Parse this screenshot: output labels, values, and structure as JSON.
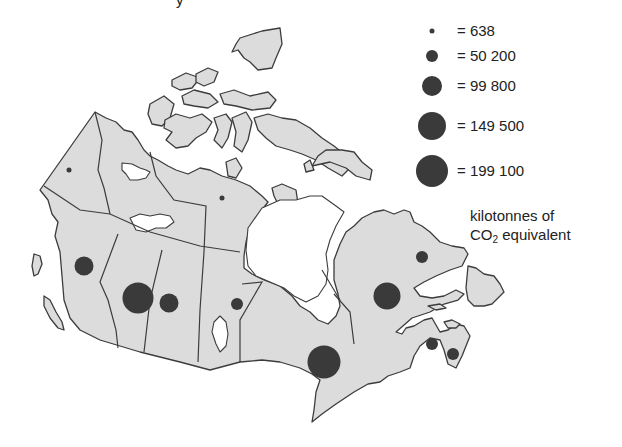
{
  "title_fragment": "y",
  "legend": {
    "items": [
      {
        "label": "= 638",
        "value": 638,
        "r": 2.5,
        "cy": 31
      },
      {
        "label": "= 50 200",
        "value": 50200,
        "r": 6,
        "cy": 56
      },
      {
        "label": "= 99 800",
        "value": 99800,
        "r": 10,
        "cy": 86
      },
      {
        "label": "= 149 500",
        "value": 149500,
        "r": 14,
        "cy": 126
      },
      {
        "label": "= 199 100",
        "value": 199100,
        "r": 16,
        "cy": 171
      }
    ],
    "unit_line1": "kilotonnes of",
    "unit_line2_prefix": "CO",
    "unit_line2_sub": "2",
    "unit_line2_suffix": " equivalent"
  },
  "colors": {
    "land": "#dcdcdc",
    "outline": "#3c3c3c",
    "bubble": "#3a3a3a",
    "water": "#ffffff"
  },
  "map": {
    "region": "Canada",
    "bubbles": [
      {
        "region": "Yukon",
        "cx": 69,
        "cy": 170,
        "r": 2.5
      },
      {
        "region": "Northwest Territories",
        "cx": 139,
        "cy": 150,
        "r": 0
      },
      {
        "region": "Nunavut",
        "cx": 222,
        "cy": 198,
        "r": 2.5
      },
      {
        "region": "British Columbia",
        "cx": 84,
        "cy": 266,
        "r": 9.5
      },
      {
        "region": "Alberta",
        "cx": 138,
        "cy": 298,
        "r": 15.5
      },
      {
        "region": "Saskatchewan",
        "cx": 169,
        "cy": 303,
        "r": 9.5
      },
      {
        "region": "Manitoba",
        "cx": 237,
        "cy": 304,
        "r": 6
      },
      {
        "region": "Ontario",
        "cx": 324,
        "cy": 362,
        "r": 16.5
      },
      {
        "region": "Quebec",
        "cx": 387,
        "cy": 296,
        "r": 13.5
      },
      {
        "region": "Newfoundland and Labrador",
        "cx": 422,
        "cy": 257,
        "r": 6
      },
      {
        "region": "New Brunswick",
        "cx": 432,
        "cy": 344,
        "r": 6
      },
      {
        "region": "Nova Scotia",
        "cx": 453,
        "cy": 354,
        "r": 6
      },
      {
        "region": "Prince Edward Island",
        "cx": 450,
        "cy": 340,
        "r": 0
      }
    ]
  }
}
